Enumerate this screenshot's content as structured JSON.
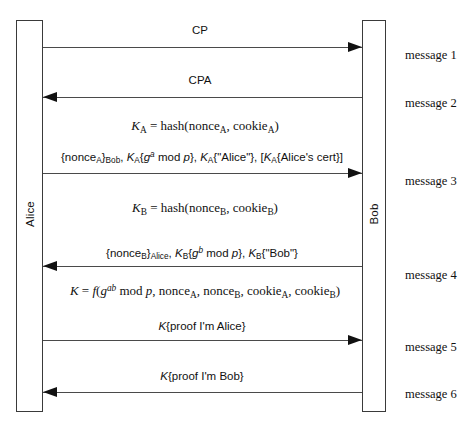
{
  "diagram": {
    "type": "sequence-diagram",
    "background": "#ffffff",
    "line_color": "#4a4a4a",
    "text_color": "#111111"
  },
  "lifelines": [
    {
      "name": "alice",
      "label": "Alice",
      "x": 16,
      "y": 20,
      "width": 27,
      "height": 392
    },
    {
      "name": "bob",
      "label": "Bob",
      "x": 362,
      "y": 20,
      "width": 24,
      "height": 392
    }
  ],
  "messages": [
    {
      "index": 1,
      "number_label": "message 1",
      "direction": "right",
      "arrow_y": 47,
      "number_y": 48,
      "label_html": "CP",
      "label_style": "sans",
      "label_center_x": 200,
      "label_y": 24
    },
    {
      "index": 2,
      "number_label": "message 2",
      "direction": "left",
      "arrow_y": 97,
      "number_y": 96,
      "label_html": "CPA",
      "label_style": "sans",
      "label_center_x": 200,
      "label_y": 74
    },
    {
      "index": 3,
      "number_label": "message 3",
      "direction": "right",
      "arrow_y": 173,
      "number_y": 174,
      "label_html": "{nonce<sub>A</sub>}<sub>Bob</sub>, <i>K</i><sub>A</sub>{<i>g</i><sup><i>a</i></sup> mod <i>p</i>}, <i>K</i><sub>A</sub>{\"Alice\"}, [<i>K</i><sub>A</sub>{Alice's cert}]",
      "label_style": "sans",
      "label_center_x": 202,
      "label_y": 150
    },
    {
      "index": 4,
      "number_label": "message 4",
      "direction": "left",
      "arrow_y": 266,
      "number_y": 268,
      "label_html": "{nonce<sub>B</sub>}<sub>Alice</sub>, <i>K</i><sub>B</sub>{<i>g</i><sup><i>b</i></sup> mod <i>p</i>}, <i>K</i><sub>B</sub>{\"Bob\"}",
      "label_style": "sans",
      "label_center_x": 202,
      "label_y": 246
    },
    {
      "index": 5,
      "number_label": "message 5",
      "direction": "right",
      "arrow_y": 340,
      "number_y": 340,
      "label_html": "<i>K</i>{proof I'm Alice}",
      "label_style": "sans",
      "label_center_x": 202,
      "label_y": 320
    },
    {
      "index": 6,
      "number_label": "message 6",
      "direction": "left",
      "arrow_y": 392,
      "number_y": 387,
      "label_html": "<i>K</i>{proof I'm Bob}",
      "label_style": "sans",
      "label_center_x": 202,
      "label_y": 370
    }
  ],
  "formulas": [
    {
      "name": "ka-formula",
      "html": "<i>K</i><sub>A</sub> = hash(nonce<sub>A</sub>, cookie<sub>A</sub>)",
      "center_x": 205,
      "y": 118
    },
    {
      "name": "kb-formula",
      "html": "<i>K</i><sub>B</sub> = hash(nonce<sub>B</sub>, cookie<sub>B</sub>)",
      "center_x": 205,
      "y": 200
    },
    {
      "name": "k-session-formula",
      "html": "<i>K</i> = <i>f</i>(<i>g</i><sup><i>ab</i></sup> mod <i>p</i>, nonce<sub>A</sub>, nonce<sub>B</sub>, cookie<sub>A</sub>, cookie<sub>B</sub>)",
      "center_x": 205,
      "y": 283
    }
  ]
}
